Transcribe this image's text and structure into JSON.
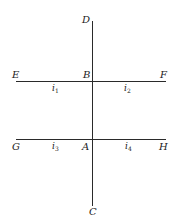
{
  "diagram": {
    "points": {
      "D": "D",
      "E": "E",
      "B": "B",
      "F": "F",
      "G": "G",
      "A": "A",
      "H": "H",
      "C": "C"
    },
    "currents": {
      "i1": {
        "base": "i",
        "sub": "1"
      },
      "i2": {
        "base": "i",
        "sub": "2"
      },
      "i3": {
        "base": "i",
        "sub": "3"
      },
      "i4": {
        "base": "i",
        "sub": "4"
      }
    },
    "lines": [
      {
        "name": "DC",
        "from": "D",
        "to": "C",
        "orientation": "vertical"
      },
      {
        "name": "EF",
        "from": "E",
        "to": "F",
        "orientation": "horizontal",
        "through": "B"
      },
      {
        "name": "GH",
        "from": "G",
        "to": "H",
        "orientation": "horizontal",
        "through": "A"
      }
    ],
    "line_color": "#2a2a2a"
  }
}
